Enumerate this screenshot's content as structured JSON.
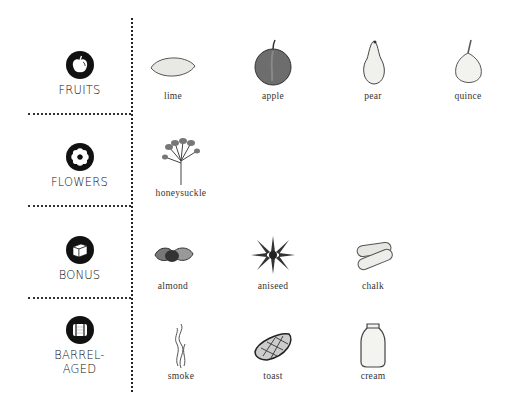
{
  "categories": [
    {
      "label": "FRUITS",
      "icon": "apple-icon",
      "items": [
        {
          "name": "lime",
          "icon": "lime-icon"
        },
        {
          "name": "apple",
          "icon": "apple-icon"
        },
        {
          "name": "pear",
          "icon": "pear-icon"
        },
        {
          "name": "quince",
          "icon": "quince-icon"
        }
      ]
    },
    {
      "label": "FLOWERS",
      "icon": "flower-icon",
      "items": [
        {
          "name": "honeysuckle",
          "icon": "honeysuckle-icon"
        }
      ]
    },
    {
      "label": "BONUS",
      "icon": "box-icon",
      "items": [
        {
          "name": "almond",
          "icon": "almond-icon"
        },
        {
          "name": "aniseed",
          "icon": "star-anise-icon"
        },
        {
          "name": "chalk",
          "icon": "chalk-icon"
        }
      ]
    },
    {
      "label_line1": "BARREL-",
      "label_line2": "AGED",
      "icon": "barrel-icon",
      "items": [
        {
          "name": "smoke",
          "icon": "smoke-icon"
        },
        {
          "name": "toast",
          "icon": "toast-icon"
        },
        {
          "name": "cream",
          "icon": "cream-jar-icon"
        }
      ]
    }
  ],
  "colors": {
    "ink": "#111111",
    "line": "#222222",
    "background": "#ffffff"
  }
}
